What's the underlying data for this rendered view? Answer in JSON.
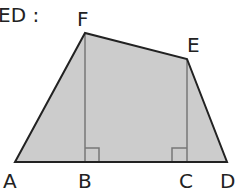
{
  "title_fragment": "ED :",
  "colors": {
    "fill": "#cccccc",
    "outline": "#222222",
    "altitude": "#777777",
    "background": "#ffffff"
  },
  "figure": {
    "type": "quadrilateral",
    "vertices": {
      "A": [
        15,
        162
      ],
      "D": [
        227,
        162
      ],
      "E": [
        187,
        59
      ],
      "F": [
        85,
        33
      ]
    },
    "feet": {
      "B": [
        85,
        162
      ],
      "C": [
        187,
        162
      ]
    },
    "right_angles_at": [
      "B",
      "C"
    ],
    "labels": [
      {
        "text": "A",
        "x": 3,
        "y": 188
      },
      {
        "text": "B",
        "x": 78,
        "y": 188
      },
      {
        "text": "C",
        "x": 179,
        "y": 188
      },
      {
        "text": "D",
        "x": 220,
        "y": 188
      },
      {
        "text": "E",
        "x": 187,
        "y": 52
      },
      {
        "text": "F",
        "x": 77,
        "y": 26
      }
    ]
  }
}
